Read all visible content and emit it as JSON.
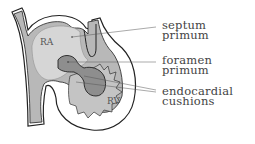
{
  "diagram": {
    "chambers": [
      {
        "id": "ra",
        "label": "RA"
      },
      {
        "id": "rv",
        "label": "RV"
      }
    ],
    "labels": [
      {
        "id": "septum-primum",
        "line1": "septum",
        "line2": "primum"
      },
      {
        "id": "foramen-primum",
        "line1": "foramen",
        "line2": "primum"
      },
      {
        "id": "endocardial-cushions",
        "line1": "endocardial",
        "line2": "cushions"
      }
    ],
    "colors": {
      "tissue": "#b8b8b8",
      "atrium_fill": "#d6d6d6",
      "cushion": "#8e8e8e",
      "outline": "#222222",
      "leader": "#555555"
    }
  }
}
